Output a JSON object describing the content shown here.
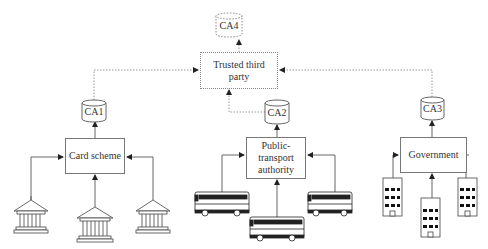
{
  "trusted_party": {
    "label": "Trusted third party",
    "ca": "CA4"
  },
  "card_scheme": {
    "label": "Card scheme",
    "ca": "CA1",
    "members_icon": "bank-building-icon",
    "member_count": 3
  },
  "transport": {
    "label": "Public-transport authority",
    "ca": "CA2",
    "members_icon": "bus-icon",
    "member_count": 3
  },
  "government": {
    "label": "Government",
    "ca": "CA3",
    "members_icon": "office-building-icon",
    "member_count": 3
  },
  "colors": {
    "line": "#777777",
    "dotted_line": "#999999",
    "text": "#333333"
  }
}
